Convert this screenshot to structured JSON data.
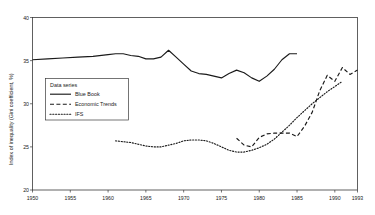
{
  "chart_data": {
    "type": "line",
    "title": "",
    "xlabel": "",
    "ylabel": "Index of inequality (Gini coefficient, %)",
    "xlim": [
      1950,
      1993
    ],
    "ylim": [
      20,
      40
    ],
    "grid": false,
    "legend_position": "inner-left",
    "legend_title": "Data series",
    "xticks": [
      1950,
      1955,
      1960,
      1965,
      1970,
      1975,
      1980,
      1985,
      1990,
      1993
    ],
    "xtick_labels": [
      "1950",
      "1955",
      "1960",
      "1965",
      "1970",
      "1975",
      "1980",
      "1985",
      "1990",
      "1993"
    ],
    "yticks": [
      20,
      25,
      30,
      35,
      40
    ],
    "ytick_labels": [
      "20",
      "25",
      "30",
      "35",
      "40"
    ],
    "series": [
      {
        "name": "Blue Book",
        "style": "solid",
        "x": [
          1950,
          1952,
          1954,
          1956,
          1958,
          1960,
          1961,
          1962,
          1963,
          1964,
          1965,
          1966,
          1967,
          1968,
          1969,
          1970,
          1971,
          1972,
          1973,
          1974,
          1975,
          1976,
          1977,
          1978,
          1979,
          1980,
          1981,
          1982,
          1983,
          1984,
          1985
        ],
        "values": [
          35.1,
          35.2,
          35.3,
          35.4,
          35.5,
          35.7,
          35.8,
          35.8,
          35.6,
          35.5,
          35.2,
          35.2,
          35.4,
          36.2,
          35.4,
          34.6,
          33.8,
          33.5,
          33.4,
          33.2,
          33.0,
          33.5,
          33.9,
          33.6,
          33.0,
          32.6,
          33.2,
          34.0,
          35.1,
          35.8,
          35.8
        ]
      },
      {
        "name": "Economic Trends",
        "style": "dashed",
        "x": [
          1977,
          1978,
          1979,
          1980,
          1981,
          1982,
          1983,
          1984,
          1985,
          1986,
          1987,
          1988,
          1989,
          1990,
          1991,
          1992,
          1993
        ],
        "values": [
          26.0,
          25.2,
          25.0,
          26.1,
          26.5,
          26.6,
          26.6,
          26.6,
          26.2,
          27.4,
          29.0,
          31.5,
          33.3,
          32.6,
          34.2,
          33.4,
          33.9
        ]
      },
      {
        "name": "IFS",
        "style": "dotted",
        "x": [
          1961,
          1962,
          1963,
          1964,
          1965,
          1966,
          1967,
          1968,
          1969,
          1970,
          1971,
          1972,
          1973,
          1974,
          1975,
          1976,
          1977,
          1978,
          1979,
          1980,
          1981,
          1982,
          1983,
          1984,
          1985,
          1986,
          1987,
          1988,
          1989,
          1990,
          1991
        ],
        "values": [
          25.7,
          25.6,
          25.5,
          25.3,
          25.1,
          25.0,
          25.0,
          25.2,
          25.4,
          25.7,
          25.8,
          25.8,
          25.7,
          25.4,
          25.0,
          24.6,
          24.4,
          24.4,
          24.6,
          24.9,
          25.3,
          25.9,
          26.7,
          27.5,
          28.4,
          29.2,
          30.0,
          30.7,
          31.4,
          32.0,
          32.6
        ]
      }
    ]
  },
  "legend": {
    "title": "Data series",
    "entries": [
      {
        "label": "Blue Book",
        "style": "solid"
      },
      {
        "label": "Economic Trends",
        "style": "dashed"
      },
      {
        "label": "IFS",
        "style": "dotted"
      }
    ]
  },
  "axes": {
    "y_title": "Index of inequality (Gini coefficient, %)"
  }
}
